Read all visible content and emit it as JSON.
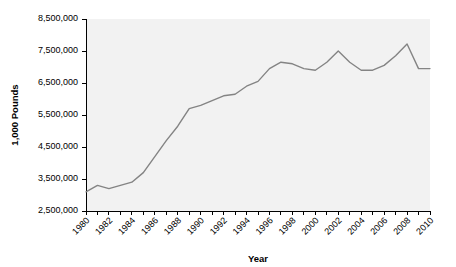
{
  "chart_data": {
    "type": "line",
    "title": "",
    "xlabel": "Year",
    "ylabel": "1,000 Pounds",
    "xlim": [
      1980,
      2010
    ],
    "ylim": [
      2500000,
      8500000
    ],
    "grid": false,
    "legend": "none",
    "line_color": "#848484",
    "plot_background": "#f2f2f2",
    "y_ticks": [
      2500000,
      3500000,
      4500000,
      5500000,
      6500000,
      7500000,
      8500000
    ],
    "y_tick_labels": [
      "2,500,000",
      "3,500,000",
      "4,500,000",
      "5,500,000",
      "6,500,000",
      "7,500,000",
      "8,500,000"
    ],
    "x_ticks": [
      1980,
      1981,
      1982,
      1983,
      1984,
      1985,
      1986,
      1987,
      1988,
      1989,
      1990,
      1991,
      1992,
      1993,
      1994,
      1995,
      1996,
      1997,
      1998,
      1999,
      2000,
      2001,
      2002,
      2003,
      2004,
      2005,
      2006,
      2007,
      2008,
      2009,
      2010
    ],
    "x_tick_labels": [
      "1980",
      "",
      "1982",
      "",
      "1984",
      "",
      "1986",
      "",
      "1988",
      "",
      "1990",
      "",
      "1992",
      "",
      "1994",
      "",
      "1996",
      "",
      "1998",
      "",
      "2000",
      "",
      "2002",
      "",
      "2004",
      "",
      "2006",
      "",
      "2008",
      "",
      "2010"
    ],
    "x": [
      1980,
      1981,
      1982,
      1983,
      1984,
      1985,
      1986,
      1987,
      1988,
      1989,
      1990,
      1991,
      1992,
      1993,
      1994,
      1995,
      1996,
      1997,
      1998,
      1999,
      2000,
      2001,
      2002,
      2003,
      2004,
      2005,
      2006,
      2007,
      2008,
      2009,
      2010
    ],
    "values": [
      3100000,
      3300000,
      3200000,
      3300000,
      3400000,
      3700000,
      4200000,
      4700000,
      5150000,
      5700000,
      5800000,
      5950000,
      6100000,
      6150000,
      6400000,
      6550000,
      6950000,
      7150000,
      7100000,
      6950000,
      6900000,
      7150000,
      7500000,
      7150000,
      6900000,
      6900000,
      7050000,
      7350000,
      7720000,
      6950000,
      6950000
    ]
  }
}
